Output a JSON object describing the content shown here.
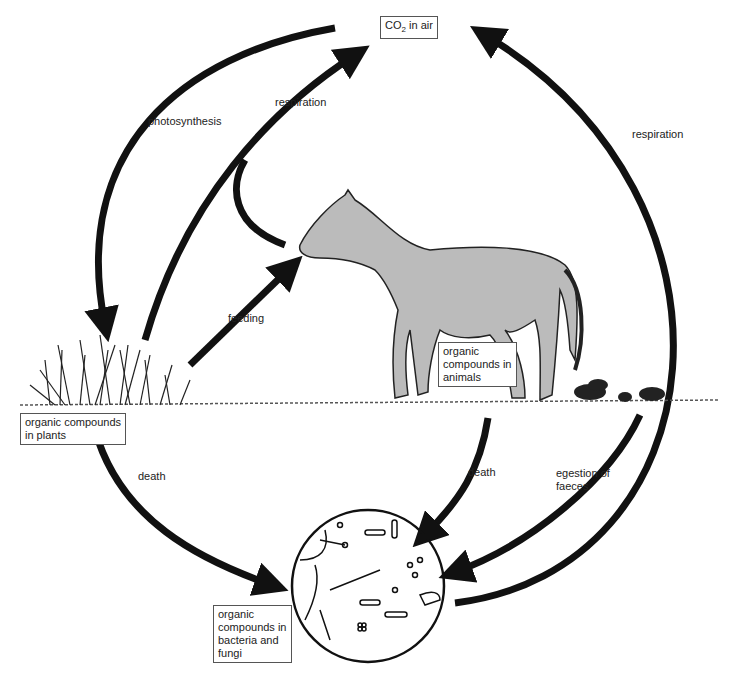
{
  "nodes": {
    "air": {
      "label_main": "CO",
      "label_sub": "2",
      "label_rest": " in air"
    },
    "plants": {
      "lines": [
        "organic compounds",
        "in plants"
      ]
    },
    "animals": {
      "lines": [
        "organic",
        "compounds in",
        "animals"
      ]
    },
    "decomposers": {
      "lines": [
        "organic",
        "compounds in",
        "bacteria and",
        "fungi"
      ]
    }
  },
  "arrows": {
    "photosynthesis": "photosynthesis",
    "respiration_plants": "respiration",
    "respiration_decomposers": "respiration",
    "feeding": "feeding",
    "death_plants": "death",
    "death_animals": "death",
    "egestion": [
      "egestion of",
      "faeces"
    ]
  },
  "colors": {
    "arrow": "#111111",
    "box_border": "#555555",
    "background": "#ffffff"
  }
}
